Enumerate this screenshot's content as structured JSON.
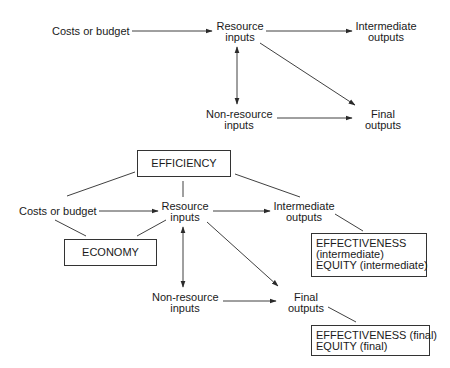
{
  "top_diagram": {
    "nodes": {
      "costs": "Costs or budget",
      "resource_inputs": [
        "Resource",
        "inputs"
      ],
      "intermediate_outputs": [
        "Intermediate",
        "outputs"
      ],
      "non_resource_inputs": [
        "Non-resource",
        "inputs"
      ],
      "final_outputs": [
        "Final",
        "outputs"
      ]
    }
  },
  "bottom_diagram": {
    "boxes": {
      "efficiency": "EFFICIENCY",
      "economy": "ECONOMY",
      "effectiveness_intermediate": [
        "EFFECTIVENESS",
        "(intermediate)",
        "EQUITY (intermediate)"
      ],
      "effectiveness_final": [
        "EFFECTIVENESS (final)",
        "EQUITY (final)"
      ]
    },
    "nodes": {
      "costs": "Costs or budget",
      "resource_inputs": [
        "Resource",
        "inputs"
      ],
      "intermediate_outputs": [
        "Intermediate",
        "outputs"
      ],
      "non_resource_inputs": [
        "Non-resource",
        "inputs"
      ],
      "final_outputs": [
        "Final",
        "outputs"
      ]
    }
  }
}
